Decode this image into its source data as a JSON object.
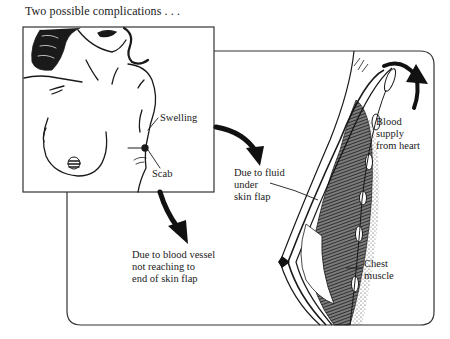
{
  "figure": {
    "title": "Two possible complications . . ."
  },
  "labels": {
    "swelling": "Swelling",
    "scab": "Scab",
    "fluid_cause": "Due to fluid\nunder\nskin flap",
    "vessel_cause": "Due to blood vessel\nnot reaching to\nend of skin flap",
    "blood_supply": "Blood\nsupply\nfrom heart",
    "chest_muscle": "Chest\nmuscle"
  },
  "panels": {
    "inset": {
      "subject": "front view of torso after mastectomy with flap reconstruction",
      "callouts": [
        "Swelling",
        "Scab"
      ]
    },
    "cross_section": {
      "subject": "cross-section of skin flap over chest wall",
      "callouts": [
        "Due to fluid under skin flap",
        "Blood supply from heart",
        "Chest muscle"
      ]
    }
  },
  "arrows": [
    {
      "from": "Swelling",
      "to": "Due to fluid under skin flap"
    },
    {
      "from": "Scab",
      "to": "Due to blood vessel not reaching to end of skin flap"
    },
    {
      "from": "cross_section_top",
      "direction": "up",
      "meaning": "Blood supply from heart"
    }
  ],
  "colors": {
    "ink": "#1a1a1a",
    "paper": "#ffffff",
    "frame": "#333333"
  }
}
